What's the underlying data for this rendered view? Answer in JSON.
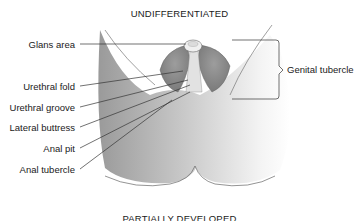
{
  "diagram": {
    "title": "UNDIFFERENTIATED",
    "next_section_title": "PARTIALLY DEVELOPED",
    "left_labels": [
      "Glans area",
      "Urethral fold",
      "Urethral groove",
      "Lateral buttress",
      "Anal pit",
      "Anal tubercle"
    ],
    "right_label": "Genital tubercle",
    "colors": {
      "line": "#333333",
      "tissue_dark": "#8c8c8c",
      "tissue_light": "#f2f2f2"
    }
  }
}
